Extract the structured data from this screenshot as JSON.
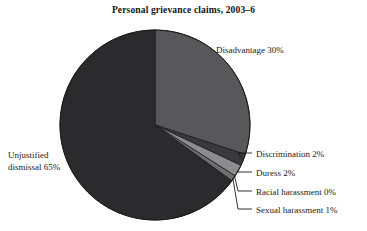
{
  "chart_data": {
    "type": "pie",
    "title": "Personal grievance claims, 2003–6",
    "xlabel": "",
    "ylabel": "",
    "legend_position": "none",
    "grid": false,
    "start_angle_deg": 0,
    "direction": "clockwise",
    "units": "percent",
    "categories": [
      "Disadvantage",
      "Discrimination",
      "Duress",
      "Racial harassment",
      "Sexual harassment",
      "Unjustified dismissal"
    ],
    "values": [
      30,
      2,
      2,
      0,
      1,
      65
    ],
    "labels": [
      "Disadvantage 30%",
      "Discrimination 2%",
      "Duress 2%",
      "Racial harassment 0%",
      "Sexual harassment 1%",
      "Unjustified dismissal 65%"
    ],
    "colors": [
      "#58585a",
      "#3a3a3c",
      "#8d8d8f",
      "#262628",
      "#6e6e70",
      "#2b2b2d"
    ]
  },
  "chart": {
    "title": "Personal grievance claims, 2003–6",
    "geometry": {
      "center_x": 155,
      "center_y": 125,
      "radius": 95
    },
    "background_color": "#ffffff",
    "outline_color": "#1a1a1a",
    "leader_line_color": "#1a1a1a"
  },
  "labels": {
    "disadvantage": "Disadvantage 30%",
    "discrimination": "Discrimination 2%",
    "duress": "Duress 2%",
    "racial_harassment": "Racial harassment 0%",
    "sexual_harassment": "Sexual harassment 1%",
    "unjustified_line1": "Unjustified",
    "unjustified_line2": "dismissal 65%"
  }
}
